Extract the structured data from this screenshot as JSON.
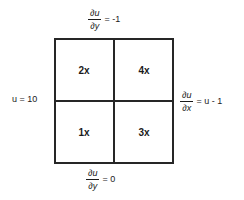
{
  "diagram": {
    "grid": {
      "rows": 2,
      "cols": 2,
      "cells": [
        {
          "position": "top-left",
          "label": "2x"
        },
        {
          "position": "top-right",
          "label": "4x"
        },
        {
          "position": "bottom-left",
          "label": "1x"
        },
        {
          "position": "bottom-right",
          "label": "3x"
        }
      ]
    },
    "boundary_conditions": {
      "top": {
        "numerator": "∂u",
        "denominator": "∂y",
        "rhs": "= -1",
        "full": "∂u/∂y = -1"
      },
      "right": {
        "numerator": "∂u",
        "denominator": "∂x",
        "rhs": "= u - 1",
        "full": "∂u/∂x = u - 1"
      },
      "bottom": {
        "numerator": "∂u",
        "denominator": "∂y",
        "rhs": "= 0",
        "full": "∂u/∂y = 0"
      },
      "left": {
        "text": "u = 10"
      }
    },
    "colors": {
      "line": "#262626",
      "text": "#1a1a1a",
      "background": "#ffffff"
    }
  }
}
